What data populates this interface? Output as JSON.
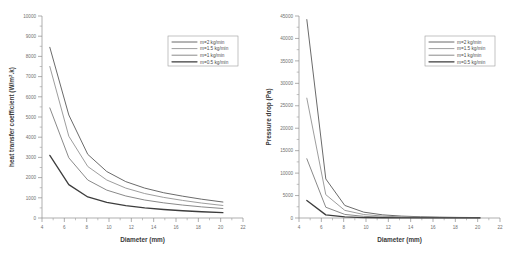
{
  "figure": {
    "background": "#ffffff",
    "panel_count": 2
  },
  "chart_data": [
    {
      "type": "line",
      "title": "",
      "xlabel": "Diameter (mm)",
      "ylabel": "heat transfer coefficient (W/m²·k)",
      "ylabel_main": "heat transfer coefficient (W/m",
      "ylabel_sup": "2",
      "ylabel_tail": ".k)",
      "xlim": [
        4,
        22
      ],
      "ylim": [
        0,
        10000
      ],
      "xticks": [
        4,
        6,
        8,
        10,
        12,
        14,
        16,
        18,
        20,
        22
      ],
      "yticks": [
        0,
        1000,
        2000,
        3000,
        4000,
        5000,
        6000,
        7000,
        8000,
        9000,
        10000
      ],
      "grid": false,
      "legend_position": "upper-right",
      "x": [
        4.7,
        6.4,
        8.1,
        9.8,
        11.5,
        13.2,
        14.9,
        16.6,
        18.3,
        20.2
      ],
      "series": [
        {
          "name": "m=2 kg/min",
          "color": "#6b6b6b",
          "width": 1.0,
          "values": [
            8450,
            5100,
            3150,
            2300,
            1800,
            1480,
            1250,
            1080,
            930,
            790
          ]
        },
        {
          "name": "m=1.5 kg/min",
          "color": "#9e9e9e",
          "width": 1.0,
          "values": [
            7500,
            4050,
            2550,
            1880,
            1480,
            1210,
            1020,
            870,
            740,
            620
          ]
        },
        {
          "name": "m=1 kg/min",
          "color": "#8a8a8a",
          "width": 1.0,
          "values": [
            5450,
            2980,
            1880,
            1380,
            1090,
            890,
            750,
            640,
            550,
            470
          ]
        },
        {
          "name": "m=0.5 kg/min",
          "color": "#3d3d3d",
          "width": 1.3,
          "values": [
            3100,
            1650,
            1040,
            770,
            610,
            500,
            420,
            360,
            310,
            265
          ]
        }
      ]
    },
    {
      "type": "line",
      "title": "",
      "xlabel": "Diameter (mm)",
      "ylabel": "Pressure drop (Pa)",
      "xlim": [
        4,
        22
      ],
      "ylim": [
        0,
        45000
      ],
      "xticks": [
        4,
        6,
        8,
        10,
        12,
        14,
        16,
        18,
        20,
        22
      ],
      "yticks": [
        0,
        5000,
        10000,
        15000,
        20000,
        25000,
        30000,
        35000,
        40000,
        45000
      ],
      "grid": false,
      "legend_position": "upper-right",
      "x": [
        4.7,
        6.4,
        8.1,
        9.8,
        11.5,
        13.2,
        14.9,
        16.6,
        18.3,
        20.2
      ],
      "series": [
        {
          "name": "m=2 kg/min",
          "color": "#6b6b6b",
          "width": 1.0,
          "values": [
            44200,
            8700,
            2800,
            1300,
            700,
            420,
            280,
            190,
            130,
            95
          ]
        },
        {
          "name": "m=1.5 kg/min",
          "color": "#9e9e9e",
          "width": 1.0,
          "values": [
            26700,
            5200,
            1700,
            780,
            420,
            250,
            165,
            115,
            80,
            58
          ]
        },
        {
          "name": "m=1 kg/min",
          "color": "#8a8a8a",
          "width": 1.0,
          "values": [
            13200,
            2400,
            800,
            370,
            200,
            120,
            78,
            54,
            38,
            27
          ]
        },
        {
          "name": "m=0.5 kg/min",
          "color": "#3d3d3d",
          "width": 1.3,
          "values": [
            3900,
            700,
            230,
            105,
            57,
            34,
            22,
            15,
            11,
            8
          ]
        }
      ]
    }
  ],
  "legend": {
    "entries": [
      "m=2 kg/min",
      "m=1.5 kg/min",
      "m=1 kg/min",
      "m=0.5 kg/min"
    ]
  }
}
